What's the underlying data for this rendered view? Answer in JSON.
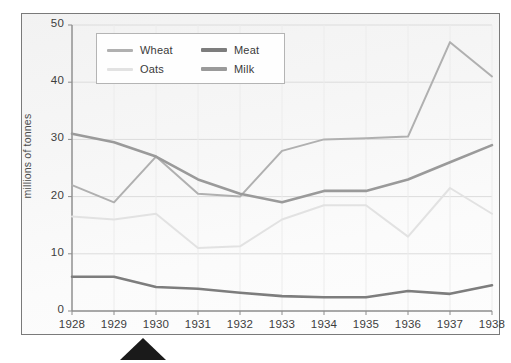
{
  "chart_data": {
    "type": "line",
    "title": "",
    "xlabel": "",
    "ylabel": "millions of tonnes",
    "categories": [
      "1928",
      "1929",
      "1930",
      "1931",
      "1932",
      "1933",
      "1934",
      "1935",
      "1936",
      "1937",
      "1938"
    ],
    "x": [
      1928,
      1929,
      1930,
      1931,
      1932,
      1933,
      1934,
      1935,
      1936,
      1937,
      1938
    ],
    "xlim": [
      1928,
      1938
    ],
    "ylim": [
      0,
      50
    ],
    "yticks": [
      0,
      10,
      20,
      30,
      40,
      50
    ],
    "ytick_labels": [
      "0",
      "10",
      "20",
      "30",
      "40",
      "50"
    ],
    "grid": true,
    "legend_position": "top-center",
    "series": [
      {
        "name": "Wheat",
        "color": "#b0b0b0",
        "values": [
          22.0,
          19.0,
          27.0,
          20.5,
          20.0,
          28.0,
          30.0,
          30.2,
          30.5,
          47.0,
          41.0
        ]
      },
      {
        "name": "Oats",
        "color": "#e2e2e2",
        "values": [
          16.5,
          16.0,
          17.0,
          11.0,
          11.3,
          16.0,
          18.5,
          18.5,
          13.0,
          21.5,
          17.0
        ]
      },
      {
        "name": "Meat",
        "color": "#7d7d7d",
        "values": [
          6.0,
          6.0,
          4.2,
          3.9,
          3.2,
          2.6,
          2.4,
          2.4,
          3.5,
          3.0,
          4.5
        ]
      },
      {
        "name": "Milk",
        "color": "#9a9a9a",
        "values": [
          31.0,
          29.5,
          27.0,
          23.0,
          20.5,
          19.0,
          21.0,
          21.0,
          23.0,
          26.0,
          29.0
        ]
      }
    ],
    "annotations": [
      {
        "name": "year-marker-triangle",
        "x": 1929.7,
        "shape": "triangle-up",
        "color": "#1a1a1a"
      }
    ]
  }
}
